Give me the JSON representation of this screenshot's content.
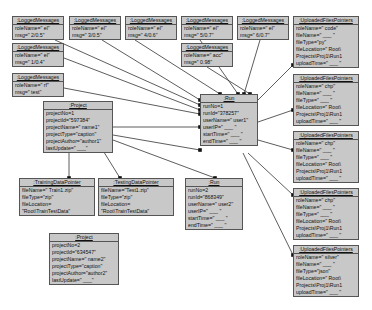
{
  "objects": [
    {
      "id": "lm1",
      "title": ":LoggedMessages",
      "x": 12,
      "y": 16,
      "w": 52,
      "h": 24,
      "attrs": [
        "roleName=\" el\"",
        "msg=\" 2/0.5\""
      ]
    },
    {
      "id": "lm2",
      "title": ":LoggedMessages",
      "x": 69,
      "y": 16,
      "w": 52,
      "h": 24,
      "attrs": [
        "roleName=\" el\"",
        "msg=\" 3/0.5\""
      ]
    },
    {
      "id": "lm3",
      "title": ":LoggedMessages",
      "x": 125,
      "y": 16,
      "w": 52,
      "h": 24,
      "attrs": [
        "roleName=\" el\"",
        "msg=\" 4/0.6\""
      ]
    },
    {
      "id": "lm4",
      "title": ":LoggedMessages",
      "x": 181,
      "y": 16,
      "w": 52,
      "h": 24,
      "attrs": [
        "roleName=\" el\"",
        "msg=\" 5/0.7\""
      ]
    },
    {
      "id": "lm5",
      "title": ":LoggedMessages",
      "x": 237,
      "y": 16,
      "w": 52,
      "h": 24,
      "attrs": [
        "roleName=\" el\"",
        "msg=\" 6/0.7\""
      ]
    },
    {
      "id": "lm6",
      "title": ":LoggedMessages",
      "x": 12,
      "y": 43,
      "w": 52,
      "h": 24,
      "attrs": [
        "roleName=\" el\"",
        "msg=\" 1/0.4\""
      ]
    },
    {
      "id": "lm7",
      "title": ":LoggedMessages",
      "x": 181,
      "y": 43,
      "w": 52,
      "h": 24,
      "attrs": [
        "roleName=\" acc\"",
        "msg=\" 0.98\""
      ]
    },
    {
      "id": "lm8",
      "title": ":LoggedMessages",
      "x": 12,
      "y": 73,
      "w": 52,
      "h": 24,
      "attrs": [
        "roleName=\" rf\"",
        "msg=\" test\""
      ]
    },
    {
      "id": "proj1",
      "title": ":Project",
      "x": 43,
      "y": 101,
      "w": 70,
      "h": 48,
      "attrs": [
        "projectNo=1",
        "projectId=\"597384\"",
        "projectName=\" name1\"",
        "projectType=\"caption\"",
        "projectAuthor=\"author1\"",
        "lastUpdate=\" ___\""
      ]
    },
    {
      "id": "run1",
      "title": ":Run",
      "x": 200,
      "y": 94,
      "w": 58,
      "h": 42,
      "attrs": [
        "runNo=1",
        "runId=\"378257\"",
        "userName=\" user1\"",
        "userIP=\" ___ \"",
        "startTime=\" ___ \"",
        "endTime=\" ___ \""
      ]
    },
    {
      "id": "train",
      "title": ":TrainingDataPointer",
      "x": 19,
      "y": 178,
      "w": 76,
      "h": 33,
      "attrs": [
        "fileName=\" Train1.zip\"",
        "fileType=\"zip\"",
        "fileLocation=",
        "  \"Root\\TrainTestData\""
      ]
    },
    {
      "id": "test",
      "title": ":TestingDataPointer",
      "x": 98,
      "y": 178,
      "w": 76,
      "h": 33,
      "attrs": [
        "fileName=\"Test1.zip\"",
        "fileType=\"zip\"",
        "fileLocation=",
        "  \"Root\\TrainTestData\""
      ]
    },
    {
      "id": "run2",
      "title": ":Run",
      "x": 185,
      "y": 178,
      "w": 58,
      "h": 42,
      "attrs": [
        "runNo=2",
        "runId=\"868349\"",
        "userName=\" user2\"",
        "userIP=\" ___ \"",
        "startTime=\" ___ \"",
        "endTime=\" ___ \""
      ]
    },
    {
      "id": "proj2",
      "title": ":Project",
      "x": 49,
      "y": 233,
      "w": 70,
      "h": 48,
      "attrs": [
        "projectNo=2",
        "projectId=\"634547\"",
        "projectName=\" name2\"",
        "projectType=\"caption\"",
        "projectAuthor=\"author2\"",
        "lastUpdate=\" ___\""
      ]
    },
    {
      "id": "uf1",
      "title": ":UploadedFilesPointers",
      "x": 293,
      "y": 16,
      "w": 66,
      "h": 50,
      "attrs": [
        "roleName=\" code\"",
        "fileName=\" ___ \"",
        "fileType=\"py\"",
        "fileLocation=\" Root\\",
        "Projects\\Proj1\\Run1",
        "uploadTime=\" ___ \""
      ]
    },
    {
      "id": "uf2",
      "title": ":UploadedFilesPointers",
      "x": 293,
      "y": 74,
      "w": 66,
      "h": 50,
      "attrs": [
        "roleName=\" chp\"",
        "fileName=\" ___ \"",
        "fileType=\" ___ \"",
        "fileLocation=\" Root\\",
        "Projects\\Proj1\\Run1",
        "uploadTime=\" ___ \""
      ]
    },
    {
      "id": "uf3",
      "title": ":UploadedFilesPointers",
      "x": 293,
      "y": 131,
      "w": 66,
      "h": 50,
      "attrs": [
        "roleName=\" chp\"",
        "fileName=\" ___ \"",
        "fileType=\" ___ \"",
        "fileLocation=\" Root\\",
        "Projects\\Proj1\\Run1",
        "uploadTime=\" ___ \""
      ]
    },
    {
      "id": "uf4",
      "title": ":UploadedFilesPointers",
      "x": 293,
      "y": 188,
      "w": 66,
      "h": 50,
      "attrs": [
        "roleName=\" chp\"",
        "fileName=\" ___ \"",
        "fileType=\" ___ \"",
        "fileLocation=\" Root\\",
        "Projects\\Proj1\\Run1",
        "uploadTime=\" ___ \""
      ]
    },
    {
      "id": "uf5",
      "title": ":UploadedFilesPointers",
      "x": 293,
      "y": 245,
      "w": 66,
      "h": 50,
      "attrs": [
        "roleName=\" silver\"",
        "fileName=\" ___ \"",
        "fileType=\"json\"",
        "fileLocation=\" Root\\",
        "Projects\\Proj1\\Run1",
        "uploadTime=\" ___ \""
      ]
    }
  ],
  "links": [
    {
      "x1": 55,
      "y1": 40,
      "x2": 200,
      "y2": 105
    },
    {
      "x1": 102,
      "y1": 40,
      "x2": 200,
      "y2": 100
    },
    {
      "x1": 135,
      "y1": 40,
      "x2": 220,
      "y2": 94
    },
    {
      "x1": 200,
      "y1": 40,
      "x2": 238,
      "y2": 94
    },
    {
      "x1": 260,
      "y1": 40,
      "x2": 244,
      "y2": 94
    },
    {
      "x1": 64,
      "y1": 58,
      "x2": 200,
      "y2": 110
    },
    {
      "x1": 207,
      "y1": 67,
      "x2": 250,
      "y2": 94
    },
    {
      "x1": 64,
      "y1": 88,
      "x2": 200,
      "y2": 114
    },
    {
      "x1": 113,
      "y1": 127,
      "x2": 200,
      "y2": 127
    },
    {
      "x1": 113,
      "y1": 135,
      "x2": 200,
      "y2": 150
    },
    {
      "x1": 69,
      "y1": 149,
      "x2": 69,
      "y2": 178
    },
    {
      "x1": 102,
      "y1": 149,
      "x2": 120,
      "y2": 178
    },
    {
      "x1": 113,
      "y1": 140,
      "x2": 215,
      "y2": 178
    },
    {
      "x1": 258,
      "y1": 100,
      "x2": 293,
      "y2": 65
    },
    {
      "x1": 258,
      "y1": 122,
      "x2": 293,
      "y2": 110
    },
    {
      "x1": 258,
      "y1": 140,
      "x2": 293,
      "y2": 150
    },
    {
      "x1": 248,
      "y1": 153,
      "x2": 293,
      "y2": 195
    },
    {
      "x1": 243,
      "y1": 153,
      "x2": 293,
      "y2": 255
    }
  ],
  "colors": {
    "box_fill": "#c8c8c8",
    "border": "#555555",
    "line": "#333333"
  }
}
